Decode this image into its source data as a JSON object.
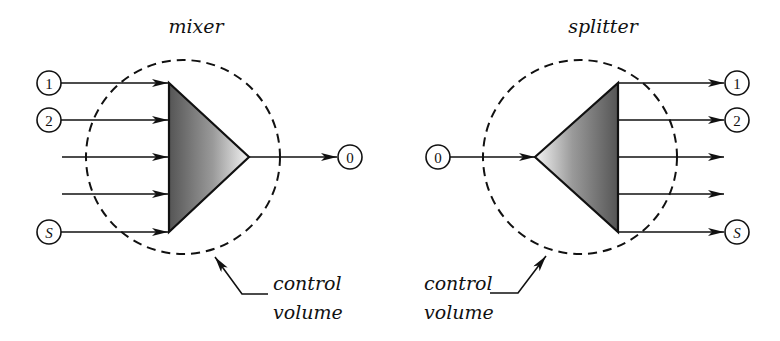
{
  "figure": {
    "mixer": {
      "title": "mixer",
      "inlet_labels": [
        "1",
        "2",
        "",
        "",
        "S"
      ],
      "outlet_label": "0",
      "control_volume_label": {
        "line1": "control",
        "line2": "volume"
      }
    },
    "splitter": {
      "title": "splitter",
      "inlet_label": "0",
      "outlet_labels": [
        "1",
        "2",
        "",
        "",
        "S"
      ],
      "control_volume_label": {
        "line1": "control",
        "line2": "volume"
      }
    },
    "colors": {
      "stroke": "#111111",
      "gradient_dark": "#555555",
      "gradient_light": "#f4f4f4",
      "background": "#ffffff"
    }
  }
}
